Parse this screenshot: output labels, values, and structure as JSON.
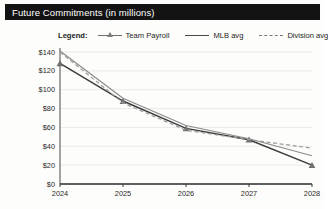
{
  "window": {
    "title": "Future Commitments (in millions)"
  },
  "legend": {
    "label": "Legend:",
    "items": [
      {
        "name": "Team Payroll",
        "style": "line-marker",
        "color": "#555555"
      },
      {
        "name": "MLB avg",
        "style": "solid",
        "color": "#4a4a4a"
      },
      {
        "name": "Division avg",
        "style": "dashed",
        "color": "#7a7a7a"
      }
    ]
  },
  "chart_data": {
    "type": "line",
    "title": "Future Commitments (in millions)",
    "xlabel": "",
    "ylabel": "",
    "x": [
      2024,
      2025,
      2026,
      2027,
      2028
    ],
    "categories": [
      "2024",
      "2025",
      "2026",
      "2027",
      "2028"
    ],
    "ylim": [
      0,
      140
    ],
    "yticks": [
      0,
      20,
      40,
      60,
      80,
      100,
      120,
      140
    ],
    "ytick_labels": [
      "$0",
      "$20",
      "$40",
      "$60",
      "$80",
      "$100",
      "$120",
      "$140"
    ],
    "xtick_labels": [
      "2024",
      "2025",
      "2026",
      "2027",
      "2028"
    ],
    "grid": true,
    "legend_position": "top",
    "series": [
      {
        "name": "Team Payroll",
        "values": [
          128,
          88,
          59,
          47,
          20
        ],
        "color": "#3c3c3c",
        "style": "solid",
        "marker": "triangle"
      },
      {
        "name": "MLB avg",
        "values": [
          141,
          91,
          62,
          48,
          30
        ],
        "color": "#8a8a8a",
        "style": "solid",
        "marker": "none"
      },
      {
        "name": "Division avg",
        "values": [
          140,
          86,
          57,
          47,
          38
        ],
        "color": "#9a9a9a",
        "style": "dashed",
        "marker": "none"
      }
    ]
  }
}
